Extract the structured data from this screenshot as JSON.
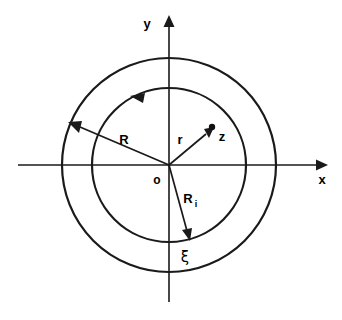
{
  "figure": {
    "type": "annulus-coordinate-diagram",
    "background_color": "#ffffff",
    "stroke_color": "#1a1a1a",
    "axes": {
      "x_label": "x",
      "y_label": "y",
      "origin_label": "o",
      "x_axis": {
        "x1": 18,
        "y1": 165,
        "x2": 322,
        "y2": 165
      },
      "y_axis": {
        "x1": 169,
        "y1": 302,
        "x2": 169,
        "y2": 18
      }
    },
    "circles": [
      {
        "name": "outer-circle",
        "label": "R",
        "cx": 169,
        "cy": 165,
        "r": 107
      },
      {
        "name": "inner-circle",
        "label": "R_i",
        "cx": 169,
        "cy": 165,
        "r": 77
      }
    ],
    "vectors": [
      {
        "name": "radius-R-arrow",
        "label": "R",
        "label_x": 120,
        "label_y": 142,
        "from": {
          "x": 169,
          "y": 165
        },
        "to": {
          "x": 73,
          "y": 124
        }
      },
      {
        "name": "radius-r-arrow",
        "label": "r",
        "label_x": 180,
        "label_y": 143,
        "from": {
          "x": 169,
          "y": 165
        },
        "to": {
          "x": 212,
          "y": 129
        }
      },
      {
        "name": "radius-Ri-arrow",
        "label": "R",
        "sublabel": "i",
        "label_x": 186,
        "label_y": 202,
        "from": {
          "x": 169,
          "y": 165
        },
        "to": {
          "x": 190,
          "y": 239
        }
      }
    ],
    "points": [
      {
        "name": "point-z",
        "label": "z",
        "x": 212,
        "y": 129,
        "label_x": 220,
        "label_y": 139
      },
      {
        "name": "point-xi",
        "label": "ξ",
        "x": 190,
        "y": 241,
        "label_x": 185,
        "label_y": 259
      }
    ],
    "arc_arrows": [
      {
        "name": "inner-circle-direction-arrow",
        "direction": "counter-clockwise",
        "at_x": 136,
        "at_y": 98
      }
    ]
  }
}
